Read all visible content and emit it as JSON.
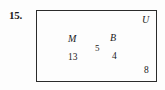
{
  "figure": {
    "problem_number": "15.",
    "universal_set_label": "U",
    "sets": [
      {
        "key": "M",
        "name": "M",
        "only_count": "13"
      },
      {
        "key": "B",
        "name": "B",
        "only_count": "4"
      }
    ],
    "intersection_count": "5",
    "outside_count": "8",
    "colors": {
      "stroke": "#2b2b2b",
      "text": "#1a1a1a",
      "background": "#fdfdfd"
    }
  },
  "chart_data": {
    "type": "venn",
    "title": "15.",
    "universe": "U",
    "sets": [
      "M",
      "B"
    ],
    "regions": [
      {
        "label": "M only",
        "value": 13
      },
      {
        "label": "M and B",
        "value": 5
      },
      {
        "label": "B only",
        "value": 4
      },
      {
        "label": "outside M and B",
        "value": 8
      }
    ],
    "total": 30
  }
}
